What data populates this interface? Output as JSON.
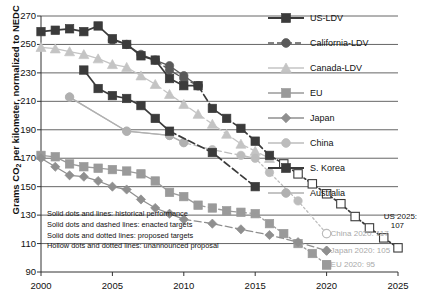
{
  "chart_data": {
    "type": "line",
    "title": "",
    "xlabel": "",
    "ylabel": "Grams CO2 per kilometer, normalized to NEDC",
    "ylabel_display": "Grams CO₂ per kilometer, normalized to NEDC",
    "xlim": [
      2000,
      2025
    ],
    "ylim": [
      90,
      270
    ],
    "yticks": [
      90,
      110,
      130,
      150,
      170,
      190,
      210,
      230,
      250,
      270
    ],
    "xticks": [
      2000,
      2005,
      2010,
      2015,
      2020,
      2025
    ],
    "grid": "horizontal",
    "legend_position": "right",
    "series": [
      {
        "name": "US-LDV",
        "marker": "square",
        "color": "#3b3b3b",
        "historical": {
          "x": [
            2000,
            2001,
            2002,
            2003,
            2004,
            2005,
            2006,
            2007,
            2008,
            2009,
            2010,
            2011
          ],
          "y": [
            259,
            260,
            261,
            259,
            263,
            254,
            250,
            242,
            239,
            226,
            221,
            221
          ]
        },
        "enacted": {
          "x": [
            2011,
            2012,
            2013,
            2014,
            2015,
            2016
          ],
          "y": [
            221,
            205,
            198,
            191,
            182,
            172
          ]
        },
        "proposed": {
          "x": [],
          "y": []
        },
        "unannounced": {
          "x": [
            2016,
            2017,
            2018,
            2019,
            2020,
            2021,
            2022,
            2023,
            2024,
            2025
          ],
          "y": [
            172,
            166,
            159,
            152,
            145,
            138,
            129,
            121,
            114,
            107
          ]
        }
      },
      {
        "name": "California-LDV",
        "marker": "circle",
        "color": "#5a5a5a",
        "historical": {
          "x": [
            2005,
            2006,
            2007,
            2008,
            2009,
            2010,
            2011
          ],
          "y": [
            253,
            250,
            243,
            239,
            235,
            228,
            221
          ]
        },
        "enacted": {
          "x": [
            2008,
            2009,
            2010,
            2011
          ],
          "y": [
            239,
            232,
            226,
            221
          ]
        },
        "proposed": {
          "x": [],
          "y": []
        },
        "unannounced": {
          "x": [],
          "y": []
        }
      },
      {
        "name": "Canada-LDV",
        "marker": "triangle",
        "color": "#c4c4c4",
        "historical": {
          "x": [
            2000,
            2001,
            2002,
            2003,
            2004,
            2005,
            2006,
            2007,
            2008
          ],
          "y": [
            248,
            247,
            245,
            243,
            240,
            236,
            234,
            228,
            222
          ]
        },
        "enacted": {
          "x": [
            2008,
            2009,
            2010,
            2011,
            2012,
            2013,
            2014,
            2015,
            2016
          ],
          "y": [
            222,
            215,
            208,
            201,
            194,
            187,
            180,
            175,
            170
          ]
        },
        "proposed": {
          "x": [],
          "y": []
        },
        "unannounced": {
          "x": [],
          "y": []
        }
      },
      {
        "name": "EU",
        "marker": "square",
        "color": "#9a9a9a",
        "historical": {
          "x": [
            2000,
            2001,
            2002,
            2003,
            2004,
            2005,
            2006,
            2007,
            2008,
            2009,
            2010,
            2011
          ],
          "y": [
            172,
            171,
            166,
            164,
            163,
            162,
            161,
            159,
            154,
            146,
            143,
            137
          ]
        },
        "enacted": {
          "x": [
            2011,
            2012,
            2013,
            2014,
            2015
          ],
          "y": [
            137,
            135,
            133,
            132,
            131
          ]
        },
        "proposed": {
          "x": [
            2015,
            2016,
            2017,
            2018,
            2019,
            2020
          ],
          "y": [
            131,
            124,
            117,
            110,
            103,
            95
          ]
        },
        "unannounced": {
          "x": [],
          "y": []
        }
      },
      {
        "name": "Japan",
        "marker": "diamond",
        "color": "#8f8f8f",
        "historical": {
          "x": [
            2000,
            2001,
            2002,
            2003,
            2004,
            2005,
            2006,
            2007,
            2008,
            2009,
            2010
          ],
          "y": [
            170,
            164,
            158,
            157,
            154,
            150,
            148,
            141,
            135,
            131,
            127
          ]
        },
        "enacted": {
          "x": [
            2010,
            2012,
            2014,
            2016,
            2018,
            2020
          ],
          "y": [
            127,
            124,
            120,
            116,
            111,
            105
          ]
        },
        "proposed": {
          "x": [],
          "y": []
        },
        "unannounced": {
          "x": [],
          "y": []
        }
      },
      {
        "name": "China",
        "marker": "circle",
        "color": "#bcbcbc",
        "historical": {
          "x": [
            2002,
            2006,
            2009,
            2010
          ],
          "y": [
            213,
            189,
            186,
            181
          ]
        },
        "enacted": {
          "x": [
            2010,
            2012,
            2014,
            2015
          ],
          "y": [
            181,
            176,
            172,
            170
          ]
        },
        "proposed": {
          "x": [
            2015,
            2016,
            2018,
            2020
          ],
          "y": [
            170,
            160,
            140,
            117
          ]
        },
        "unannounced": {
          "x": [],
          "y": []
        }
      },
      {
        "name": "S. Korea",
        "marker": "square",
        "color": "#3b3b3b",
        "historical": {
          "x": [
            2003,
            2004,
            2005,
            2006,
            2007,
            2008,
            2009
          ],
          "y": [
            232,
            219,
            214,
            212,
            207,
            198,
            189
          ]
        },
        "enacted": {
          "x": [
            2009,
            2012,
            2015
          ],
          "y": [
            189,
            174,
            150
          ]
        },
        "proposed": {
          "x": [],
          "y": []
        },
        "unannounced": {
          "x": [],
          "y": []
        }
      },
      {
        "name": "Australia",
        "marker": "circle",
        "color": "#b0b0b0",
        "historical": {
          "x": [
            2002,
            2006,
            2009,
            2010
          ],
          "y": [
            213,
            189,
            186,
            181
          ]
        },
        "enacted": {
          "x": [],
          "y": []
        },
        "proposed": {
          "x": [],
          "y": []
        },
        "unannounced": {
          "x": [],
          "y": []
        }
      }
    ],
    "annotations": [
      {
        "id": "us-2025",
        "text_line1": "US 2025:",
        "text_line2": "107",
        "value": 107,
        "year": 2025,
        "color": "#111111"
      },
      {
        "id": "china-2020",
        "text": "China 2020: 117",
        "value": 117,
        "year": 2020,
        "color": "#a9a9a9"
      },
      {
        "id": "japan-2020",
        "text": "Japan 2020: 105",
        "value": 105,
        "year": 2020,
        "color": "#a9a9a9"
      },
      {
        "id": "eu-2020",
        "text": "EU 2020: 95",
        "value": 95,
        "year": 2020,
        "color": "#a9a9a9"
      }
    ],
    "notes": [
      "Solid dots and lines: historical performance",
      "Solid dots and dashed lines: enacted targets",
      "Solid dots and dotted lines: proposed targets",
      "Hollow dots and dotted lines: unannounced proposal"
    ]
  },
  "axis": {
    "ylabel": "Grams CO₂ per kilometer, normalized to NEDC",
    "yticks": [
      "270",
      "250",
      "230",
      "210",
      "190",
      "170",
      "150",
      "130",
      "110",
      "90"
    ],
    "xticks": [
      "2000",
      "2005",
      "2010",
      "2015",
      "2020",
      "2025"
    ]
  },
  "legend": {
    "items": [
      {
        "label": "US-LDV",
        "marker": "square",
        "color": "#3b3b3b",
        "line": "solid"
      },
      {
        "label": "California-LDV",
        "marker": "circle",
        "color": "#5a5a5a",
        "line": "dashed"
      },
      {
        "label": "Canada-LDV",
        "marker": "triangle",
        "color": "#c4c4c4",
        "line": "solid"
      },
      {
        "label": "EU",
        "marker": "square",
        "color": "#9a9a9a",
        "line": "solid"
      },
      {
        "label": "Japan",
        "marker": "diamond",
        "color": "#8f8f8f",
        "line": "solid"
      },
      {
        "label": "China",
        "marker": "circle",
        "color": "#bcbcbc",
        "line": "solid"
      },
      {
        "label": "S. Korea",
        "marker": "square",
        "color": "#3b3b3b",
        "line": "solid"
      },
      {
        "label": "Australia",
        "marker": "circle",
        "color": "#b0b0b0",
        "line": "solid"
      }
    ]
  },
  "notes_box": {
    "line1": "Solid dots and lines: historical performance",
    "line2": "Solid dots and dashed lines: enacted targets",
    "line3": "Solid dots and dotted lines: proposed targets",
    "line4": "Hollow dots and dotted lines: unannounced proposal"
  },
  "annotations": {
    "us_line1": "US 2025:",
    "us_line2": "107",
    "china": "China 2020: 117",
    "japan": "Japan 2020: 105",
    "eu": "EU 2020: 95"
  }
}
